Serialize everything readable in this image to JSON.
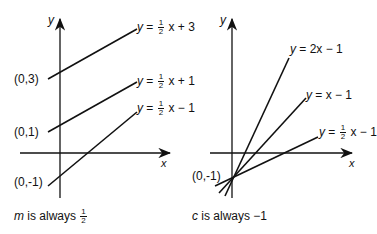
{
  "left_panel": {
    "axis_y_label": "y",
    "axis_x_label": "x",
    "intercept_labels": [
      "(0,3)",
      "(0,1)",
      "(0,-1)"
    ],
    "equations": [
      {
        "lhs": "y",
        "eq": "=",
        "num": "1",
        "den": "2",
        "rest": "x + 3"
      },
      {
        "lhs": "y",
        "eq": "=",
        "num": "1",
        "den": "2",
        "rest": "x + 1"
      },
      {
        "lhs": "y",
        "eq": "=",
        "num": "1",
        "den": "2",
        "rest": "x − 1"
      }
    ],
    "caption": {
      "var": "m",
      "text": " is always ",
      "num": "1",
      "den": "2"
    }
  },
  "right_panel": {
    "axis_y_label": "y",
    "axis_x_label": "x",
    "intercept_label": "(0,-1)",
    "equations": [
      {
        "text_lhs": "y",
        "text_rhs": " = 2x − 1"
      },
      {
        "text_lhs": "y",
        "text_rhs": " = x − 1"
      },
      {
        "lhs": "y",
        "eq": "=",
        "num": "1",
        "den": "2",
        "rest": "x − 1"
      }
    ],
    "caption": {
      "var": "c",
      "text": " is always −1"
    }
  },
  "colors": {
    "ink": "#111111",
    "background": "#ffffff"
  }
}
